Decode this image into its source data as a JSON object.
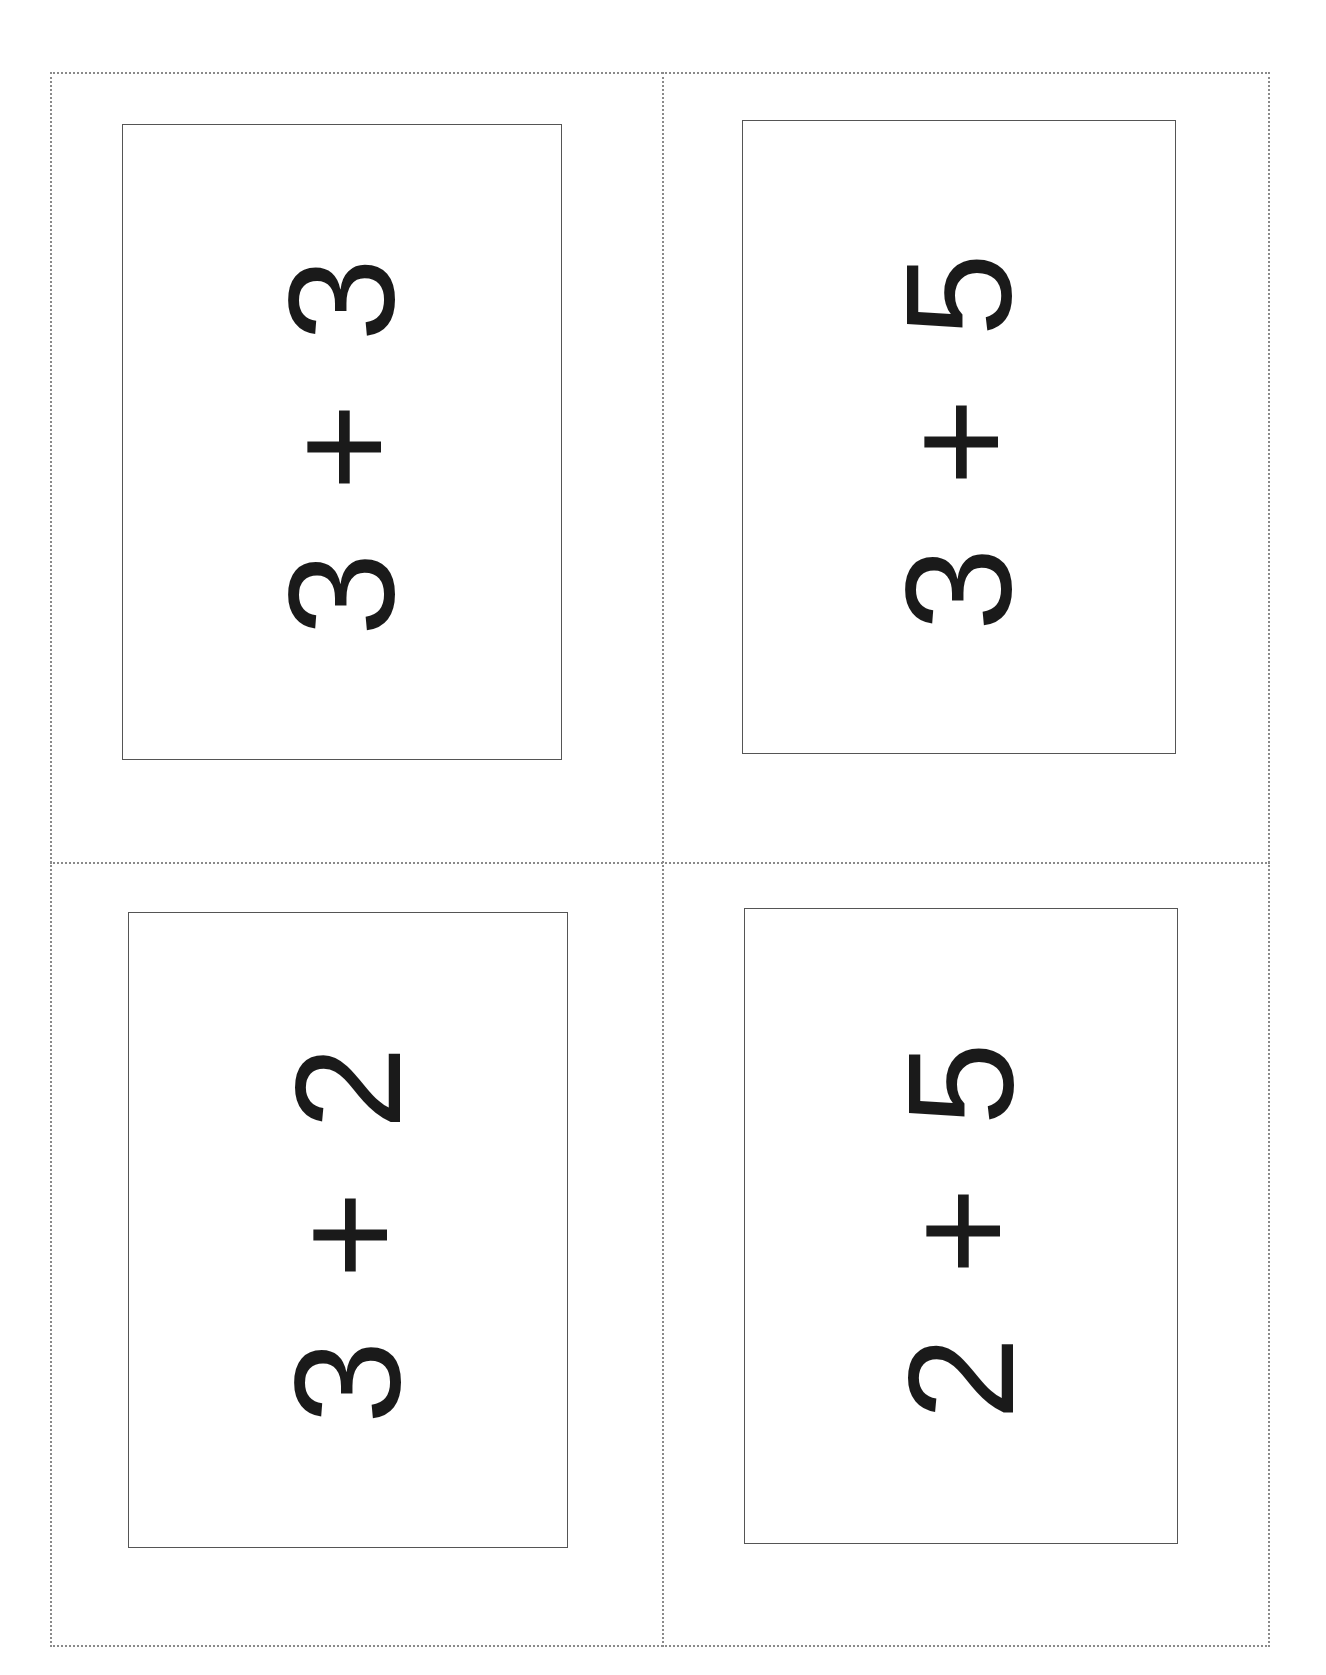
{
  "cards": [
    {
      "position": "top-left",
      "expression": "3 + 3"
    },
    {
      "position": "top-right",
      "expression": "3 + 5"
    },
    {
      "position": "bottom-left",
      "expression": "3 + 2"
    },
    {
      "position": "bottom-right",
      "expression": "2 + 5"
    }
  ],
  "colors": {
    "cut_line": "#8a8a8a",
    "card_border": "#555555",
    "text": "#1a1a1a"
  }
}
